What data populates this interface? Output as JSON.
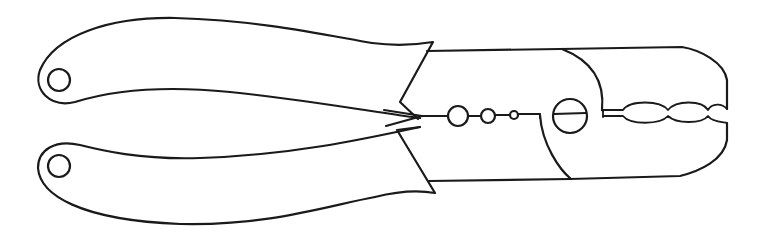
{
  "figure": {
    "style": "black line drawing on white background",
    "stroke_color": "#1a1a1a",
    "background_color": "#ffffff",
    "parts": {
      "upper_handle": {
        "hanging_hole": true
      },
      "lower_handle": {
        "hanging_hole": true
      },
      "stripping_holes_count": 3,
      "pivot_screw": {
        "type": "slotted"
      },
      "crimp_jaw_cavities_count": 3
    }
  }
}
